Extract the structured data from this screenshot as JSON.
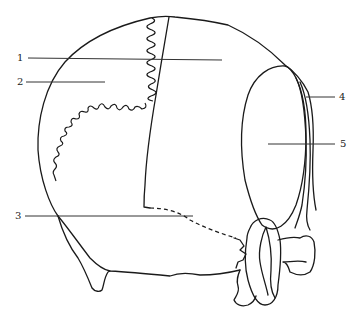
{
  "figure": {
    "type": "anatomical line drawing",
    "labels": [
      {
        "id": "1",
        "text": "1",
        "x": 17,
        "y": 58
      },
      {
        "id": "2",
        "text": "2",
        "x": 17,
        "y": 82
      },
      {
        "id": "3",
        "text": "3",
        "x": 15,
        "y": 216
      },
      {
        "id": "4",
        "text": "4",
        "x": 340,
        "y": 98
      },
      {
        "id": "5",
        "text": "5",
        "x": 341,
        "y": 145
      }
    ],
    "line_color": "#1a1a1a",
    "background": "#ffffff"
  }
}
